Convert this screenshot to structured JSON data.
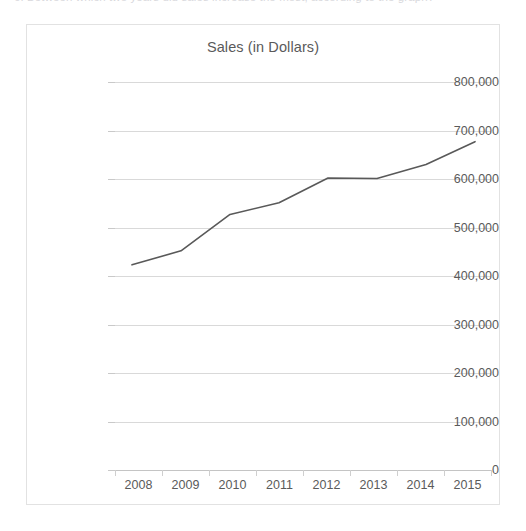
{
  "page": {
    "clipped_text_top": "6. Between which two years did sales increase the most, according to the graph?"
  },
  "chart_data": {
    "type": "line",
    "title": "Sales (in Dollars)",
    "xlabel": "",
    "ylabel": "",
    "categories": [
      "2008",
      "2009",
      "2010",
      "2011",
      "2012",
      "2013",
      "2014",
      "2015"
    ],
    "values": [
      423000,
      452000,
      527000,
      551000,
      602000,
      601000,
      630000,
      677000
    ],
    "series": [
      {
        "name": "Sales",
        "values": [
          423000,
          452000,
          527000,
          551000,
          602000,
          601000,
          630000,
          677000
        ]
      }
    ],
    "ylim": [
      0,
      800000
    ],
    "yticks": [
      0,
      100000,
      200000,
      300000,
      400000,
      500000,
      600000,
      700000,
      800000
    ],
    "ytick_labels": [
      "0",
      "100,000",
      "200,000",
      "300,000",
      "400,000",
      "500,000",
      "600,000",
      "700,000",
      "800,000"
    ],
    "grid": true,
    "legend": false,
    "legend_position": "none",
    "line_color": "#595959",
    "grid_color": "#d9d9d9",
    "text_color": "#5a5a5a",
    "border_color": "#e2e2e2",
    "background_color": "#ffffff",
    "markers": false,
    "line_width": 1.6
  }
}
